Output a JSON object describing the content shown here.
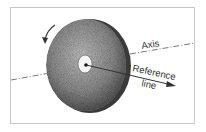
{
  "diagram": {
    "labels": {
      "axis": "Axis",
      "reference_line_1": "Reference",
      "reference_line_2": "line"
    },
    "elements": [
      "rotation-arrow",
      "wheel-disc",
      "center-hole",
      "axis-line",
      "reference-line-arrow"
    ],
    "colors": {
      "frame": "#c8c8c8",
      "wheel": "#8a8a8a",
      "line": "#555555"
    }
  }
}
